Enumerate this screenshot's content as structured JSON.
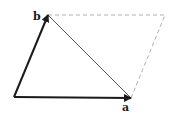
{
  "diagram": {
    "type": "vector-parallelogram",
    "vectors": [
      {
        "name": "a",
        "label": "a",
        "from": [
          14,
          97
        ],
        "to": [
          131,
          98
        ],
        "style": "bold-arrow"
      },
      {
        "name": "b",
        "label": "b",
        "from": [
          14,
          97
        ],
        "to": [
          48,
          15
        ],
        "style": "bold-arrow"
      }
    ],
    "difference_line": {
      "from": [
        48,
        15
      ],
      "to": [
        131,
        98
      ],
      "style": "thin-solid"
    },
    "completion_lines": [
      {
        "from": [
          48,
          15
        ],
        "to": [
          165,
          15
        ],
        "style": "dashed"
      },
      {
        "from": [
          131,
          98
        ],
        "to": [
          165,
          15
        ],
        "style": "dashed"
      }
    ],
    "colors": {
      "vector": "#1a1a1a",
      "thin": "#555555",
      "dashed": "#b0b0b0"
    }
  }
}
